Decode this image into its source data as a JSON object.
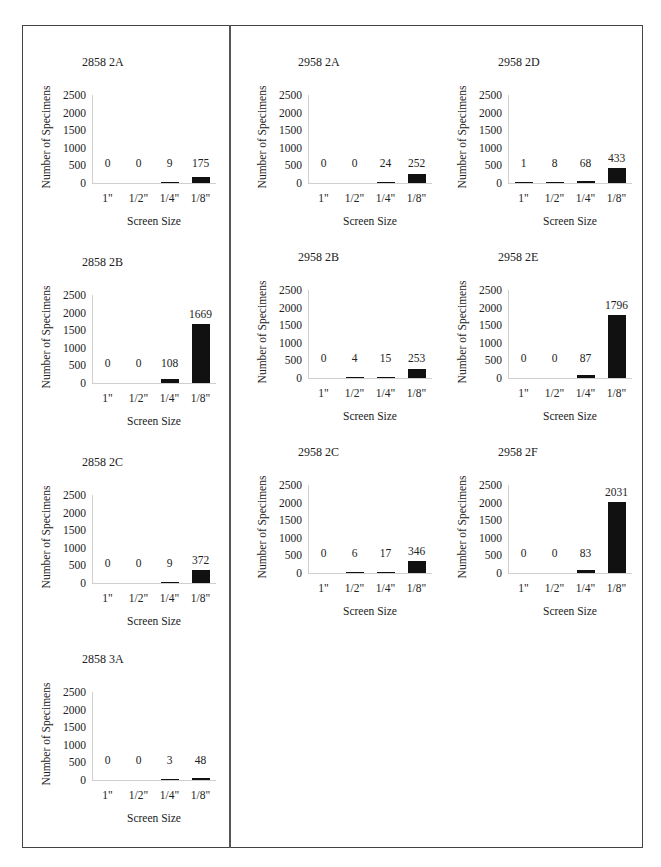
{
  "page": {
    "common": {
      "ylabel": "Number of Specimens",
      "xlabel": "Screen Size",
      "yticks": [
        "2500",
        "2000",
        "1500",
        "1000",
        "500",
        "0"
      ],
      "categories": [
        "1\"",
        "1/2\"",
        "1/4\"",
        "1/8\""
      ],
      "bar_color": "#111111",
      "axis_color": "#cfcfcf",
      "frame_color": "#444444"
    }
  },
  "chart_data": [
    {
      "type": "bar",
      "title": "2858 2A",
      "categories": [
        "1\"",
        "1/2\"",
        "1/4\"",
        "1/8\""
      ],
      "values": [
        0,
        0,
        9,
        175
      ],
      "labels": [
        "0",
        "0",
        "9",
        "175"
      ],
      "xlabel": "Screen Size",
      "ylabel": "Number of Specimens",
      "ylim": [
        0,
        2500
      ],
      "grid": false,
      "legend": "none"
    },
    {
      "type": "bar",
      "title": "2858 2B",
      "categories": [
        "1\"",
        "1/2\"",
        "1/4\"",
        "1/8\""
      ],
      "values": [
        0,
        0,
        108,
        1669
      ],
      "labels": [
        "0",
        "0",
        "108",
        "1669"
      ],
      "xlabel": "Screen Size",
      "ylabel": "Number of Specimens",
      "ylim": [
        0,
        2500
      ],
      "grid": false,
      "legend": "none"
    },
    {
      "type": "bar",
      "title": "2858 2C",
      "categories": [
        "1\"",
        "1/2\"",
        "1/4\"",
        "1/8\""
      ],
      "values": [
        0,
        0,
        9,
        372
      ],
      "labels": [
        "0",
        "0",
        "9",
        "372"
      ],
      "xlabel": "Screen Size",
      "ylabel": "Number of Specimens",
      "ylim": [
        0,
        2500
      ],
      "grid": false,
      "legend": "none"
    },
    {
      "type": "bar",
      "title": "2858 3A",
      "categories": [
        "1\"",
        "1/2\"",
        "1/4\"",
        "1/8\""
      ],
      "values": [
        0,
        0,
        3,
        48
      ],
      "labels": [
        "0",
        "0",
        "3",
        "48"
      ],
      "xlabel": "Screen Size",
      "ylabel": "Number of Specimens",
      "ylim": [
        0,
        2500
      ],
      "grid": false,
      "legend": "none"
    },
    {
      "type": "bar",
      "title": "2958 2A",
      "categories": [
        "1\"",
        "1/2\"",
        "1/4\"",
        "1/8\""
      ],
      "values": [
        0,
        0,
        24,
        252
      ],
      "labels": [
        "0",
        "0",
        "24",
        "252"
      ],
      "xlabel": "Screen Size",
      "ylabel": "Number of Specimens",
      "ylim": [
        0,
        2500
      ],
      "grid": false,
      "legend": "none"
    },
    {
      "type": "bar",
      "title": "2958 2B",
      "categories": [
        "1\"",
        "1/2\"",
        "1/4\"",
        "1/8\""
      ],
      "values": [
        0,
        4,
        15,
        253
      ],
      "labels": [
        "0",
        "4",
        "15",
        "253"
      ],
      "xlabel": "Screen Size",
      "ylabel": "Number of Specimens",
      "ylim": [
        0,
        2500
      ],
      "grid": false,
      "legend": "none"
    },
    {
      "type": "bar",
      "title": "2958 2C",
      "categories": [
        "1\"",
        "1/2\"",
        "1/4\"",
        "1/8\""
      ],
      "values": [
        0,
        6,
        17,
        346
      ],
      "labels": [
        "0",
        "6",
        "17",
        "346"
      ],
      "xlabel": "Screen Size",
      "ylabel": "Number of Specimens",
      "ylim": [
        0,
        2500
      ],
      "grid": false,
      "legend": "none"
    },
    {
      "type": "bar",
      "title": "2958 2D",
      "categories": [
        "1\"",
        "1/2\"",
        "1/4\"",
        "1/8\""
      ],
      "values": [
        1,
        8,
        68,
        433
      ],
      "labels": [
        "1",
        "8",
        "68",
        "433"
      ],
      "xlabel": "Screen Size",
      "ylabel": "Number of Specimens",
      "ylim": [
        0,
        2500
      ],
      "grid": false,
      "legend": "none"
    },
    {
      "type": "bar",
      "title": "2958 2E",
      "categories": [
        "1\"",
        "1/2\"",
        "1/4\"",
        "1/8\""
      ],
      "values": [
        0,
        0,
        87,
        1796
      ],
      "labels": [
        "0",
        "0",
        "87",
        "1796"
      ],
      "xlabel": "Screen Size",
      "ylabel": "Number of Specimens",
      "ylim": [
        0,
        2500
      ],
      "grid": false,
      "legend": "none"
    },
    {
      "type": "bar",
      "title": "2958 2F",
      "categories": [
        "1\"",
        "1/2\"",
        "1/4\"",
        "1/8\""
      ],
      "values": [
        0,
        0,
        83,
        2031
      ],
      "labels": [
        "0",
        "0",
        "83",
        "2031"
      ],
      "xlabel": "Screen Size",
      "ylabel": "Number of Specimens",
      "ylim": [
        0,
        2500
      ],
      "grid": false,
      "legend": "none"
    }
  ]
}
